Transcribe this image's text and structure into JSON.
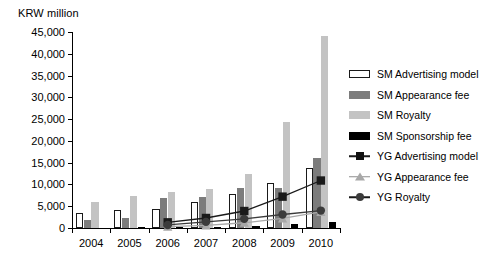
{
  "chart_data": {
    "type": "bar",
    "title": "",
    "subtitle": "",
    "xlabel": "",
    "ylabel": "KRW million",
    "ylim": [
      0,
      45000
    ],
    "ytick_labels": [
      "0",
      "5,000",
      "10,000",
      "15,000",
      "20,000",
      "25,000",
      "30,000",
      "35,000",
      "40,000",
      "45,000"
    ],
    "ytick_values": [
      0,
      5000,
      10000,
      15000,
      20000,
      25000,
      30000,
      35000,
      40000,
      45000
    ],
    "grid": false,
    "legend_position": "right",
    "categories": [
      "2004",
      "2005",
      "2006",
      "2007",
      "2008",
      "2009",
      "2010"
    ],
    "bar_series": [
      {
        "name": "SM Advertising model",
        "color": "#ffffff",
        "edge_color": "#1a1a1a",
        "values": [
          3400,
          4100,
          4300,
          5900,
          7700,
          10400,
          13800
        ]
      },
      {
        "name": "SM Appearance fee",
        "color": "#7c7c7c",
        "edge_color": "#7c7c7c",
        "values": [
          1900,
          2200,
          7000,
          7200,
          9300,
          9300,
          16000
        ]
      },
      {
        "name": "SM Royalty",
        "color": "#c3c3c3",
        "edge_color": "#c3c3c3",
        "values": [
          6000,
          7400,
          8300,
          8900,
          12400,
          24300,
          44000
        ]
      },
      {
        "name": "SM Sponsorship fee",
        "color": "#000000",
        "edge_color": "#000000",
        "values": [
          0,
          200,
          200,
          300,
          400,
          1000,
          1300
        ]
      }
    ],
    "line_series": [
      {
        "name": "YG Advertising model",
        "color": "#1a1a1a",
        "marker": "square",
        "values": [
          null,
          null,
          1300,
          2300,
          3900,
          7200,
          10900
        ]
      },
      {
        "name": "YG Appearance fee",
        "color": "#a8a8a8",
        "marker": "triangle",
        "values": [
          null,
          null,
          300,
          600,
          1200,
          2200,
          3700
        ]
      },
      {
        "name": "YG Royalty",
        "color": "#3b3b3b",
        "marker": "circle",
        "values": [
          null,
          null,
          700,
          1400,
          2100,
          3100,
          4000
        ]
      }
    ]
  },
  "legend": {
    "items": [
      {
        "label": "SM Advertising model",
        "key_type": "swatch",
        "key_class": "adv",
        "marker": ""
      },
      {
        "label": "SM Appearance fee",
        "key_type": "swatch",
        "key_class": "app",
        "marker": ""
      },
      {
        "label": "SM Royalty",
        "key_type": "swatch",
        "key_class": "roy",
        "marker": ""
      },
      {
        "label": "SM Sponsorship fee",
        "key_type": "swatch",
        "key_class": "spo",
        "marker": ""
      },
      {
        "label": "YG Advertising model",
        "key_type": "line",
        "key_class": "dark",
        "marker": "square"
      },
      {
        "label": "YG Appearance fee",
        "key_type": "line",
        "key_class": "mid",
        "marker": "triangle"
      },
      {
        "label": "YG Royalty",
        "key_type": "line",
        "key_class": "dark",
        "marker": "circle"
      }
    ]
  }
}
